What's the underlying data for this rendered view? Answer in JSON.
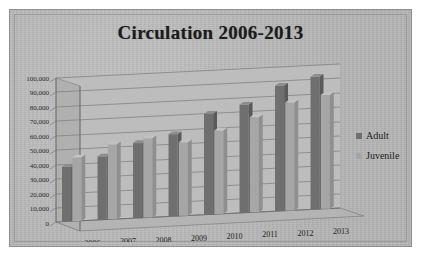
{
  "chart_data": {
    "type": "bar",
    "title": "Circulation 2006-2013",
    "xlabel": "",
    "ylabel": "",
    "categories": [
      "2006",
      "2007",
      "2008",
      "2009",
      "2010",
      "2011",
      "2012",
      "2013"
    ],
    "series": [
      {
        "name": "Adult",
        "color": "#6f6f6f",
        "values": [
          38000,
          44000,
          52000,
          57000,
          70000,
          75000,
          87000,
          92000
        ]
      },
      {
        "name": "Juvenile",
        "color": "#a6a6a6",
        "values": [
          44000,
          52000,
          55000,
          51000,
          58000,
          66000,
          75000,
          79000
        ]
      }
    ],
    "ylim": [
      0,
      100000
    ],
    "ytick_step": 10000,
    "ytick_labels": [
      "100,000",
      "90,000",
      "80,000",
      "70,000",
      "60,000",
      "50,000",
      "40,000",
      "30,000",
      "20,000",
      "10,000",
      "0"
    ],
    "grid": true,
    "legend_position": "right",
    "style": "3d-clustered-column-grayscale"
  },
  "legend": {
    "items": [
      {
        "label": "Adult",
        "color": "#6f6f6f",
        "icon": "square-swatch-icon"
      },
      {
        "label": "Juvenile",
        "color": "#a6a6a6",
        "icon": "square-swatch-icon"
      }
    ]
  }
}
